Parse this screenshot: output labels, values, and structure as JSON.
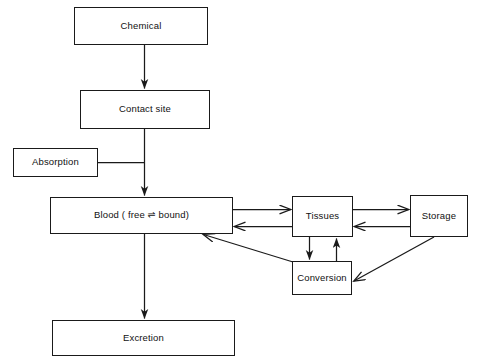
{
  "diagram": {
    "type": "flowchart",
    "canvas": {
      "width": 479,
      "height": 363
    },
    "style": {
      "box_border_color": "#1a1a1a",
      "arrow_color": "#1a1a1a",
      "background": "#ffffff",
      "text_color": "#111111"
    },
    "nodes": [
      {
        "id": "chemical",
        "label": "Chemical",
        "x": 74,
        "y": 7,
        "w": 134,
        "h": 38
      },
      {
        "id": "contact",
        "label": "Contact site",
        "x": 80,
        "y": 90,
        "w": 130,
        "h": 39
      },
      {
        "id": "absorption",
        "label": "Absorption",
        "x": 13,
        "y": 148,
        "w": 85,
        "h": 29
      },
      {
        "id": "blood",
        "label": "Blood ( free ⇌ bound)",
        "x": 50,
        "y": 197,
        "w": 183,
        "h": 37
      },
      {
        "id": "tissues",
        "label": "Tissues",
        "x": 292,
        "y": 196,
        "w": 61,
        "h": 41
      },
      {
        "id": "storage",
        "label": "Storage",
        "x": 410,
        "y": 195,
        "w": 58,
        "h": 42
      },
      {
        "id": "conversion",
        "label": "Conversion",
        "x": 292,
        "y": 261,
        "w": 60,
        "h": 34
      },
      {
        "id": "excretion",
        "label": "Excretion",
        "x": 52,
        "y": 320,
        "w": 183,
        "h": 36
      }
    ],
    "edges": [
      {
        "id": "chemical-to-contact",
        "from": "chemical",
        "to": "contact",
        "kind": "arrow",
        "direction": "down"
      },
      {
        "id": "contact-to-blood",
        "from": "contact",
        "to": "blood",
        "kind": "arrow",
        "direction": "down"
      },
      {
        "id": "absorption-to-spine",
        "from": "absorption",
        "to": "contact-blood-spine",
        "kind": "line",
        "direction": "right"
      },
      {
        "id": "blood-to-excretion",
        "from": "blood",
        "to": "excretion",
        "kind": "arrow",
        "direction": "down"
      },
      {
        "id": "blood-to-tissues",
        "from": "blood",
        "to": "tissues",
        "kind": "arrow",
        "direction": "right"
      },
      {
        "id": "tissues-to-blood",
        "from": "tissues",
        "to": "blood",
        "kind": "arrow",
        "direction": "left"
      },
      {
        "id": "tissues-to-storage",
        "from": "tissues",
        "to": "storage",
        "kind": "arrow",
        "direction": "right"
      },
      {
        "id": "storage-to-tissues",
        "from": "storage",
        "to": "tissues",
        "kind": "arrow",
        "direction": "left"
      },
      {
        "id": "tissues-to-conversion",
        "from": "tissues",
        "to": "conversion",
        "kind": "arrow",
        "direction": "down"
      },
      {
        "id": "conversion-to-tissues",
        "from": "conversion",
        "to": "tissues",
        "kind": "arrow",
        "direction": "up"
      },
      {
        "id": "conversion-to-blood",
        "from": "conversion",
        "to": "blood",
        "kind": "arrow",
        "direction": "diagonal-up-left"
      },
      {
        "id": "storage-to-conversion",
        "from": "storage",
        "to": "conversion",
        "kind": "arrow",
        "direction": "diagonal-down-left"
      }
    ]
  }
}
